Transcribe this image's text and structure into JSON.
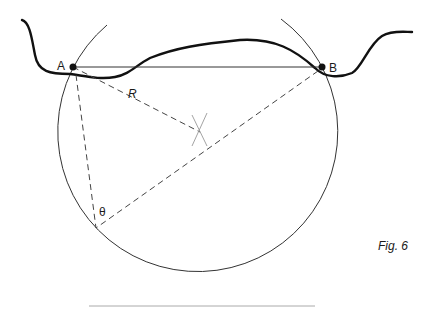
{
  "diagram": {
    "caption": "Fig. 6",
    "labels": {
      "point_a": "A",
      "point_b": "B",
      "radius": "R",
      "angle": "θ"
    },
    "colors": {
      "ink": "#1a1a1a",
      "line": "#333333",
      "dash": "#444444",
      "construction": "#999999",
      "background": "#ffffff"
    }
  }
}
